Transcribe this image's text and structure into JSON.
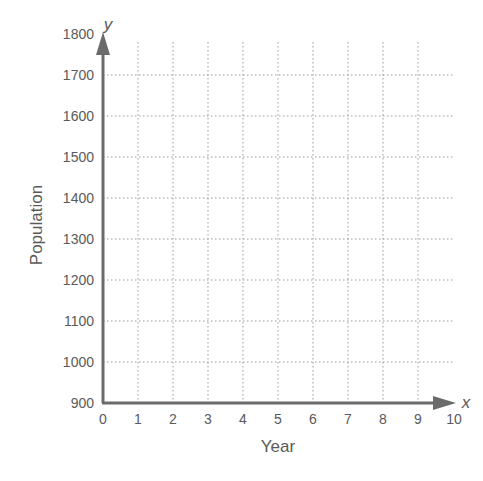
{
  "chart_data": {
    "type": "line",
    "title": "",
    "xlabel": "Year",
    "ylabel": "Population",
    "x_axis_variable": "x",
    "y_axis_variable": "y",
    "xlim": [
      0,
      10
    ],
    "ylim": [
      900,
      1800
    ],
    "x_ticks": [
      "0",
      "1",
      "2",
      "3",
      "4",
      "5",
      "6",
      "7",
      "8",
      "9",
      "10"
    ],
    "y_ticks": [
      "900",
      "1000",
      "1100",
      "1200",
      "1300",
      "1400",
      "1500",
      "1600",
      "1700",
      "1800"
    ],
    "grid": true,
    "grid_style": "dotted",
    "series": [],
    "legend": null
  },
  "colors": {
    "axis": "#6b6b6b",
    "grid": "#9a9a9a",
    "text": "#5a5a5a"
  }
}
